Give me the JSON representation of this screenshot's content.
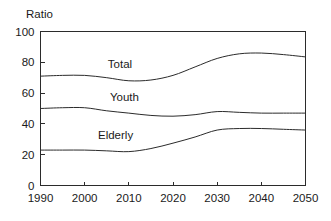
{
  "chart_data": {
    "type": "line",
    "title": "",
    "ylabel": "Ratio",
    "xlabel": "",
    "xlim": [
      1990,
      2050
    ],
    "ylim": [
      0,
      100
    ],
    "grid": false,
    "legend_position": "inline-labels",
    "x_ticks": [
      "1990",
      "2000",
      "2010",
      "2020",
      "2030",
      "2040",
      "2050"
    ],
    "y_ticks": [
      "0",
      "20",
      "40",
      "60",
      "80",
      "100"
    ],
    "x": [
      1990,
      1995,
      2000,
      2005,
      2010,
      2015,
      2020,
      2025,
      2030,
      2035,
      2040,
      2045,
      2050
    ],
    "series": [
      {
        "name": "Total",
        "values": [
          71,
          71.5,
          71.5,
          70,
          68,
          68.5,
          71.5,
          77,
          82.5,
          85.5,
          86,
          85,
          83.5
        ],
        "label_x": 2008,
        "label_y": 76
      },
      {
        "name": "Youth",
        "values": [
          50,
          50.5,
          50.5,
          48.5,
          47,
          45.5,
          45,
          46,
          48,
          47.5,
          47,
          47,
          47
        ],
        "label_x": 2009,
        "label_y": 55
      },
      {
        "name": "Elderly",
        "values": [
          23,
          23,
          23,
          22.5,
          22,
          24,
          27.5,
          31.5,
          36,
          37,
          37,
          36.5,
          36
        ],
        "label_x": 2007,
        "label_y": 30
      }
    ]
  },
  "colors": {
    "line": "#2b2b2b",
    "axis": "#2b2b2b",
    "text": "#1a1a1a",
    "background": "#ffffff"
  }
}
